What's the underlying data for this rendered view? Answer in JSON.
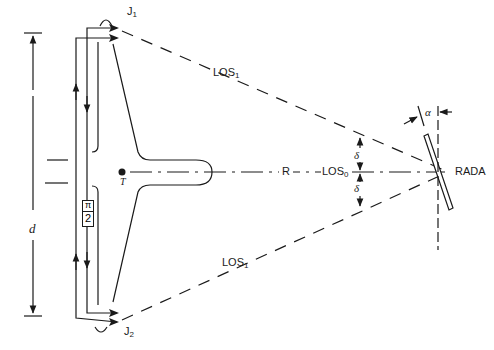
{
  "diagram": {
    "type": "radar-jamming-geometry",
    "labels": {
      "jammer_top": {
        "main": "J",
        "sub": "1"
      },
      "jammer_bottom": {
        "main": "J",
        "sub": "2"
      },
      "los_top": {
        "main": "LOS",
        "sub": "1"
      },
      "los_bottom": {
        "main": "LOS",
        "sub": "1"
      },
      "los_center": {
        "main": "LOS",
        "sub": "0"
      },
      "range": "R",
      "radar": "RADA",
      "target": "T",
      "baseline": "d",
      "delta_top": "δ",
      "delta_bottom": "δ",
      "alpha": "α",
      "phase_num": "π",
      "phase_den": "2"
    },
    "colors": {
      "stroke": "#1a1a1a",
      "background": "#ffffff"
    }
  }
}
